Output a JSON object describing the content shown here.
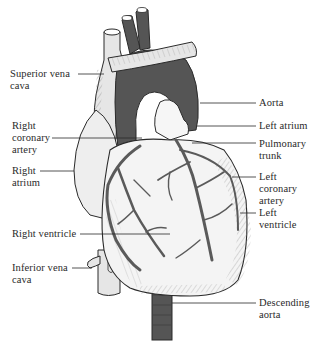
{
  "diagram": {
    "colors": {
      "background": "#ffffff",
      "ink": "#2a2a2a",
      "aorta_fill": "#555555",
      "vein_fill": "#e6e6e6",
      "muscle_fill": "#f4f4f4",
      "vessel_line": "#5a5a5a"
    },
    "labels_left": [
      {
        "id": "superior-vena-cava",
        "text": "Superior vena\ncava"
      },
      {
        "id": "right-coronary-artery",
        "text": "Right\ncoronary\nartery"
      },
      {
        "id": "right-atrium",
        "text": "Right\natrium"
      },
      {
        "id": "right-ventricle",
        "text": "Right ventricle"
      },
      {
        "id": "inferior-vena-cava",
        "text": "Inferior vena\ncava"
      }
    ],
    "labels_right": [
      {
        "id": "aorta",
        "text": "Aorta"
      },
      {
        "id": "left-atrium",
        "text": "Left atrium"
      },
      {
        "id": "pulmonary-trunk",
        "text": "Pulmonary\ntrunk"
      },
      {
        "id": "left-coronary-artery",
        "text": "Left\ncoronary\nartery"
      },
      {
        "id": "left-ventricle",
        "text": "Left\nventricle"
      },
      {
        "id": "descending-aorta",
        "text": "Descending\naorta"
      }
    ]
  }
}
